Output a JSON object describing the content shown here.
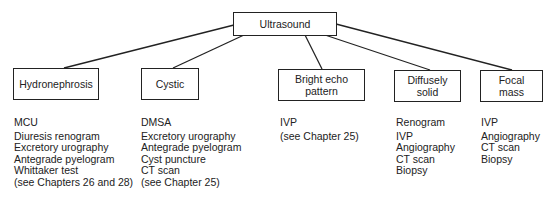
{
  "root": {
    "label": "Ultrasound"
  },
  "categories": [
    {
      "label_lines": [
        "Hydronephrosis"
      ],
      "first": "MCU",
      "items": [
        "Diuresis renogram",
        "Excretory urography",
        "Antegrade pyelogram",
        "Whittaker test",
        "(see Chapters 26 and 28)"
      ]
    },
    {
      "label_lines": [
        "Cystic"
      ],
      "first": "DMSA",
      "items": [
        "Excretory urography",
        "Antegrade pyelogram",
        "Cyst puncture",
        "CT scan",
        "(see Chapter 25)"
      ]
    },
    {
      "label_lines": [
        "Bright echo",
        "pattern"
      ],
      "first": "IVP",
      "items": [
        "(see Chapter 25)"
      ]
    },
    {
      "label_lines": [
        "Diffusely",
        "solid"
      ],
      "first": "Renogram",
      "items": [
        "IVP",
        "Angiography",
        "CT scan",
        "Biopsy"
      ]
    },
    {
      "label_lines": [
        "Focal",
        "mass"
      ],
      "first": "IVP",
      "items": [
        "Angiography",
        "CT scan",
        "Biopsy"
      ]
    }
  ],
  "colors": {
    "line": "#222222",
    "text": "#222222",
    "background": "#ffffff"
  }
}
